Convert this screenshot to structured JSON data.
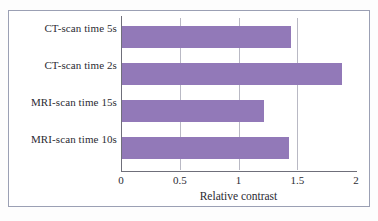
{
  "chart_data": {
    "type": "bar",
    "orientation": "horizontal",
    "title": "",
    "xlabel": "Relative contrast",
    "ylabel": "",
    "xlim": [
      0,
      2
    ],
    "xticks": [
      "0",
      "0.5",
      "1",
      "1.5",
      "2"
    ],
    "xtick_values": [
      0,
      0.5,
      1,
      1.5,
      2
    ],
    "grid": true,
    "grid_axis": "x",
    "legend": false,
    "bar_color": "#9279b8",
    "categories": [
      "CT-scan time 5s",
      "CT-scan time 2s",
      "MRI-scan time 15s",
      "MRI-scan time 10s"
    ],
    "values": [
      1.45,
      1.88,
      1.22,
      1.43
    ]
  }
}
